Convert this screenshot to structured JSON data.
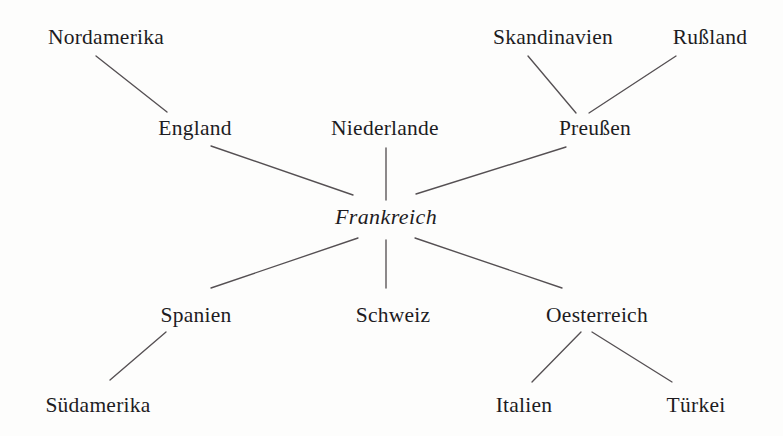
{
  "diagram": {
    "title": "Frankreich",
    "type": "radial-network",
    "background_color": "#fdfdfc",
    "text_color": "#1d1c1f",
    "line_color": "#555053",
    "center_node": {
      "id": "frankreich",
      "label": "Frankreich",
      "style": "italic",
      "x": 386,
      "y": 222
    },
    "nodes": [
      {
        "id": "nordamerika",
        "label": "Nordamerika",
        "x": 106,
        "y": 42,
        "level": 2
      },
      {
        "id": "skandinavien",
        "label": "Skandinavien",
        "x": 553,
        "y": 42,
        "level": 2
      },
      {
        "id": "russland",
        "label": "Rußland",
        "x": 710,
        "y": 42,
        "level": 2
      },
      {
        "id": "england",
        "label": "England",
        "x": 195,
        "y": 133,
        "level": 1
      },
      {
        "id": "niederlande",
        "label": "Niederlande",
        "x": 385,
        "y": 133,
        "level": 1
      },
      {
        "id": "preussen",
        "label": "Preußen",
        "x": 595,
        "y": 133,
        "level": 1
      },
      {
        "id": "spanien",
        "label": "Spanien",
        "x": 196,
        "y": 320,
        "level": 1
      },
      {
        "id": "schweiz",
        "label": "Schweiz",
        "x": 393,
        "y": 320,
        "level": 1
      },
      {
        "id": "oesterreich",
        "label": "Oesterreich",
        "x": 597,
        "y": 320,
        "level": 1
      },
      {
        "id": "suedamerika",
        "label": "Südamerika",
        "x": 98,
        "y": 410,
        "level": 2
      },
      {
        "id": "italien",
        "label": "Italien",
        "x": 524,
        "y": 410,
        "level": 2
      },
      {
        "id": "tuerkei",
        "label": "Türkei",
        "x": 696,
        "y": 410,
        "level": 2
      }
    ],
    "edges": [
      {
        "from": "nordamerika",
        "to": "england",
        "x1": 96,
        "y1": 56,
        "x2": 167,
        "y2": 112
      },
      {
        "from": "england",
        "to": "frankreich",
        "x1": 211,
        "y1": 146,
        "x2": 353,
        "y2": 195
      },
      {
        "from": "niederlande",
        "to": "frankreich",
        "x1": 386,
        "y1": 148,
        "x2": 386,
        "y2": 200
      },
      {
        "from": "skandinavien",
        "to": "preussen",
        "x1": 528,
        "y1": 56,
        "x2": 576,
        "y2": 113
      },
      {
        "from": "russland",
        "to": "preussen",
        "x1": 676,
        "y1": 56,
        "x2": 589,
        "y2": 113
      },
      {
        "from": "preussen",
        "to": "frankreich",
        "x1": 566,
        "y1": 147,
        "x2": 416,
        "y2": 194
      },
      {
        "from": "frankreich",
        "to": "spanien",
        "x1": 358,
        "y1": 238,
        "x2": 211,
        "y2": 288
      },
      {
        "from": "frankreich",
        "to": "schweiz",
        "x1": 386,
        "y1": 240,
        "x2": 386,
        "y2": 288
      },
      {
        "from": "frankreich",
        "to": "oesterreich",
        "x1": 415,
        "y1": 238,
        "x2": 562,
        "y2": 288
      },
      {
        "from": "spanien",
        "to": "suedamerika",
        "x1": 166,
        "y1": 332,
        "x2": 110,
        "y2": 380
      },
      {
        "from": "oesterreich",
        "to": "italien",
        "x1": 581,
        "y1": 332,
        "x2": 532,
        "y2": 382
      },
      {
        "from": "oesterreich",
        "to": "tuerkei",
        "x1": 592,
        "y1": 332,
        "x2": 672,
        "y2": 382
      }
    ]
  }
}
